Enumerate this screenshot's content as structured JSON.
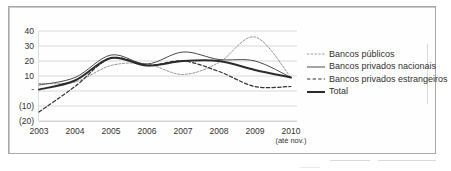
{
  "chart_data": {
    "type": "line",
    "title": "",
    "subtitle": "",
    "xlabel": "",
    "ylabel": "",
    "grid": true,
    "legend_position": "right",
    "x": [
      "2003",
      "2004",
      "2005",
      "2006",
      "2007",
      "2008",
      "2009",
      "2010"
    ],
    "x_tick_labels": [
      "2003",
      "2004",
      "2005",
      "2006",
      "2007",
      "2008",
      "2009",
      "2010"
    ],
    "x_tick_sublabel": "(até nov.)",
    "y_tick_labels": [
      "40",
      "30",
      "20",
      "10",
      "-",
      "(10)",
      "(20)"
    ],
    "y_tick_values": [
      40,
      30,
      20,
      10,
      0,
      -10,
      -20
    ],
    "ylim": [
      -20,
      40
    ],
    "series": [
      {
        "name": "Bancos públicos",
        "style": "fine-dashed",
        "color": "#8f8f8f",
        "values": [
          5,
          6,
          17,
          18,
          11,
          19,
          36,
          9
        ]
      },
      {
        "name": "Bancos privados nacionais",
        "style": "thin-solid",
        "color": "#4a4a4a",
        "values": [
          4,
          9,
          24,
          18,
          26,
          21,
          20,
          9
        ]
      },
      {
        "name": "Bancos privados estrangeiros",
        "style": "dashed",
        "color": "#333333",
        "values": [
          -14,
          3,
          22,
          17,
          20,
          13,
          3,
          3
        ]
      },
      {
        "name": "Total",
        "style": "thick-solid",
        "color": "#2b2b2b",
        "values": [
          1,
          7,
          22,
          17,
          20,
          20,
          14,
          9
        ]
      }
    ]
  },
  "legend": {
    "items": [
      {
        "label": "Bancos públicos",
        "swatch": "fine-dashed-swatch"
      },
      {
        "label": "Bancos privados nacionais",
        "swatch": "thin-solid-swatch"
      },
      {
        "label": "Bancos privados estrangeiros",
        "swatch": "dashed-swatch"
      },
      {
        "label": "Total",
        "swatch": "thick-solid-swatch"
      }
    ]
  },
  "axes": {
    "y_labels": [
      "40",
      "30",
      "20",
      "10",
      "-",
      "(10)",
      "(20)"
    ],
    "x_labels": [
      "2003",
      "2004",
      "2005",
      "2006",
      "2007",
      "2008",
      "2009",
      "2010"
    ],
    "x_sublabel": "(até nov.)"
  },
  "colors": {
    "frame": "#a9a9a9",
    "grid": "#cfcfcf",
    "text": "#33312f",
    "publicos": "#8f8f8f",
    "nacionais": "#4a4a4a",
    "estrangeiros": "#333333",
    "total": "#2b2b2b"
  }
}
